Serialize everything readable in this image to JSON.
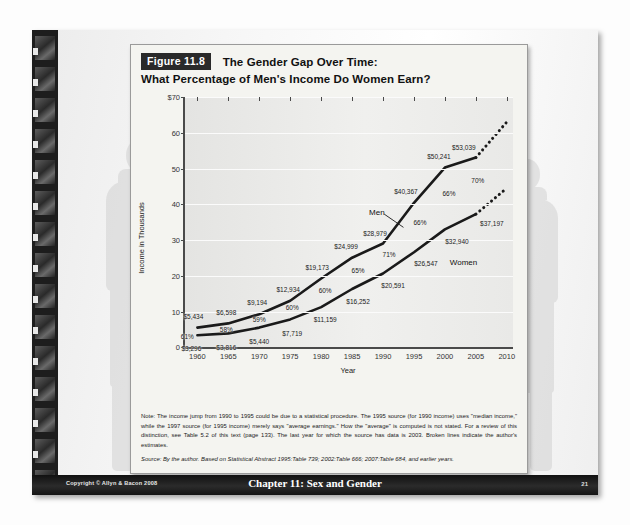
{
  "slide": {
    "figure_badge": "Figure 11.8",
    "title_line1": "The Gender Gap Over Time:",
    "title_line2": "What Percentage of Men's Income Do Women Earn?",
    "note": "Note: The income jump from 1990 to 1995 could be due to a statistical procedure. The 1995 source (for 1990 income) uses \"median income,\" while the 1997 source (for 1995 income) merely says \"average earnings.\" How the \"average\" is computed is not stated. For a review of this distinction, see Table 5.2 of this text (page 133). The last year for which the source has data is 2003. Broken lines indicate the author's estimates.",
    "source": "Source: By the author. Based on Statistical Abstract 1995:Table 739; 2002:Table 666; 2007:Table 684, and earlier years.",
    "copyright": "Copyright © Allyn & Bacon 2008",
    "chapter": "Chapter 11: Sex and Gender",
    "page_number": "21"
  },
  "chart_data": {
    "type": "line",
    "title": "The Gender Gap Over Time: What Percentage of Men's Income Do Women Earn?",
    "xlabel": "Year",
    "ylabel": "Income in Thousands",
    "xlim": [
      1958,
      2011
    ],
    "ylim": [
      0,
      70
    ],
    "yticks": [
      0,
      10,
      20,
      30,
      40,
      50,
      60,
      70
    ],
    "ytick_labels": [
      "0",
      "10",
      "20",
      "30",
      "40",
      "50",
      "60",
      "$70"
    ],
    "xticks": [
      1960,
      1965,
      1970,
      1975,
      1980,
      1985,
      1990,
      1995,
      2000,
      2005,
      2010
    ],
    "grid": true,
    "legend_position": "inline-annotations",
    "x": [
      1960,
      1965,
      1970,
      1975,
      1980,
      1985,
      1990,
      1995,
      2000,
      2005,
      2010
    ],
    "series": [
      {
        "name": "Men",
        "values": [
          5434,
          6598,
          9194,
          12934,
          19173,
          24999,
          28979,
          40367,
          50241,
          53039,
          63000
        ],
        "labels": [
          "$5,434",
          "$6,598",
          "$9,194",
          "$12,934",
          "$19,173",
          "$24,999",
          "$28,979",
          "$40,367",
          "$50,241",
          "$53,039",
          ""
        ],
        "estimated_from": 2005
      },
      {
        "name": "Women",
        "values": [
          3296,
          3816,
          5440,
          7719,
          11159,
          16252,
          20591,
          26547,
          32940,
          37197,
          44500
        ],
        "labels": [
          "$3,296",
          "$3,816",
          "$5,440",
          "$7,719",
          "$11,159",
          "$16,252",
          "$20,591",
          "$26,547",
          "$32,940",
          "$37,197",
          ""
        ],
        "estimated_from": 2005
      }
    ],
    "ratio_labels": {
      "name": "Women's income as percentage of men's",
      "x": [
        1960,
        1965,
        1970,
        1975,
        1980,
        1985,
        1990,
        1995,
        2000,
        2005
      ],
      "values": [
        "61%",
        "58%",
        "59%",
        "60%",
        "60%",
        "65%",
        "71%",
        "66%",
        "66%",
        "70%"
      ]
    },
    "annotations": [
      {
        "text": "Men",
        "x": 1989,
        "y": 38
      },
      {
        "text": "Women",
        "x": 2003,
        "y": 24
      }
    ]
  }
}
